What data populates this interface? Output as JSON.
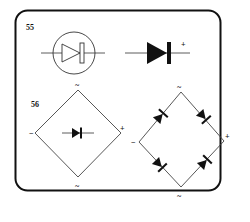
{
  "figures": [
    {
      "number": "55",
      "items": [
        {
          "name": "diode-in-circle-symbol",
          "description": "diode symbol enclosed in circle"
        },
        {
          "name": "diode-symbol",
          "terminal_label": "+"
        }
      ]
    },
    {
      "number": "56",
      "items": [
        {
          "name": "bridge-rectifier-symbol",
          "labels": {
            "top": "~",
            "left": "−",
            "right": "+",
            "bottom": "~"
          }
        },
        {
          "name": "bridge-rectifier-circuit",
          "labels": {
            "top": "~",
            "left": "−",
            "right": "+",
            "bottom": "~"
          },
          "diode_count": 4
        }
      ]
    }
  ],
  "colors": {
    "stroke": "#111111",
    "fill": "#111111",
    "line": "#555555",
    "background": "#ffffff"
  }
}
